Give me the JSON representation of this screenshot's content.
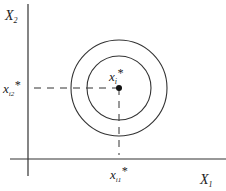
{
  "diagram": {
    "y_axis_label": "X",
    "y_axis_sub": "2",
    "x_axis_label": "X",
    "x_axis_sub": "1",
    "point_label": "x",
    "point_sub": "i",
    "point_star": "*",
    "x_tick_label": "x",
    "x_tick_sub": "i1",
    "x_tick_star": "*",
    "y_tick_label": "x",
    "y_tick_sub": "i2",
    "y_tick_star": "*",
    "colors": {
      "line": "#333333",
      "background": "#ffffff"
    }
  }
}
